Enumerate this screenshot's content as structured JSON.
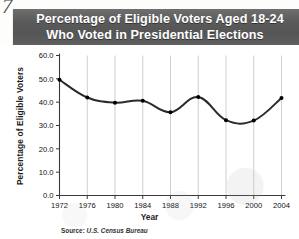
{
  "page_number": "7",
  "header": {
    "title_line1": "Percentage of Eligible Voters Aged 18-24",
    "title_line2": "Who Voted in Presidential Elections",
    "band_color": "#5a5a5a",
    "title_color": "#ffffff"
  },
  "source": {
    "label": "Source:",
    "value": "U.S. Census Bureau"
  },
  "chart_data": {
    "type": "line",
    "title": "Percentage of Eligible Voters Aged 18-24 Who Voted in Presidential Elections",
    "xlabel": "Year",
    "ylabel": "Percentage of Eligible Voters",
    "categories": [
      "1972",
      "1976",
      "1980",
      "1984",
      "1988",
      "1992",
      "1996",
      "2000",
      "2004"
    ],
    "x": [
      1972,
      1976,
      1980,
      1984,
      1988,
      1992,
      1996,
      2000,
      2004
    ],
    "values": [
      49.6,
      42.0,
      39.8,
      40.6,
      35.7,
      42.2,
      32.3,
      32.1,
      41.8
    ],
    "ytick_labels": [
      "0.0",
      "10.0",
      "20.0",
      "30.0",
      "40.0",
      "50.0",
      "60.0"
    ],
    "ytick_values": [
      0,
      10,
      20,
      30,
      40,
      50,
      60
    ],
    "ylim": [
      0,
      60
    ],
    "xlim": [
      1972,
      2004
    ],
    "grid": "vertical",
    "legend": "none",
    "line_color": "#2b2b2b",
    "marker_color": "#000000",
    "gridline_color": "#c9c9c9",
    "smoothing": "spline"
  }
}
